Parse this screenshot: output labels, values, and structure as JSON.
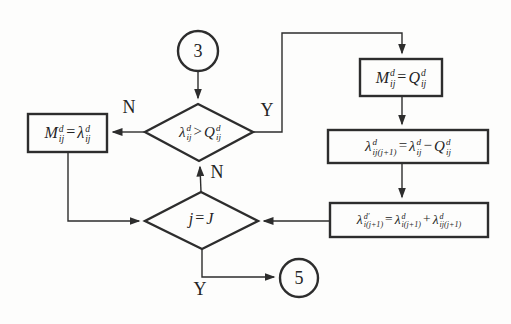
{
  "diagram": {
    "kind": "flowchart",
    "background_color": "#fdfdfc",
    "stroke_color": "#2d2d2d",
    "nodes": {
      "connector_3": {
        "shape": "circle",
        "label": "3"
      },
      "connector_5": {
        "shape": "circle",
        "label": "5"
      },
      "decision_lambda_vs_q": {
        "shape": "diamond",
        "formula": [
          {
            "b": "λ",
            "sup": "d",
            "sub": "ij"
          },
          {
            "b": ">"
          },
          {
            "b": "Q",
            "sup": "d",
            "sub": "ij"
          }
        ]
      },
      "process_m_eq_lambda": {
        "shape": "rect",
        "formula": [
          {
            "b": "M",
            "sup": "d",
            "sub": "ij"
          },
          {
            "b": "="
          },
          {
            "b": "λ",
            "sup": "d",
            "sub": "ij"
          }
        ]
      },
      "process_m_eq_q": {
        "shape": "rect",
        "formula": [
          {
            "b": "M",
            "sup": "d",
            "sub": "ij"
          },
          {
            "b": "="
          },
          {
            "b": "Q",
            "sup": "d",
            "sub": "ij"
          }
        ]
      },
      "process_lambda_carryover": {
        "shape": "rect",
        "formula": [
          {
            "b": "λ",
            "sup": "d",
            "sub": "ij(j+1)"
          },
          {
            "b": "="
          },
          {
            "b": "λ",
            "sup": "d",
            "sub": "ij"
          },
          {
            "b": "−"
          },
          {
            "b": "Q",
            "sup": "d",
            "sub": "ij"
          }
        ]
      },
      "process_lambda_sum": {
        "shape": "rect",
        "formula": [
          {
            "b": "λ",
            "sup": "d′",
            "sub": "i(j+1)"
          },
          {
            "b": "="
          },
          {
            "b": "λ",
            "sup": "d",
            "sub": "i(j+1)"
          },
          {
            "b": "+"
          },
          {
            "b": "λ",
            "sup": "d",
            "sub": "ij(j+1)"
          }
        ]
      },
      "decision_j_eq_J": {
        "shape": "diamond",
        "formula": [
          {
            "b": "j"
          },
          {
            "b": "="
          },
          {
            "b": "J"
          }
        ]
      }
    },
    "branch_labels": {
      "no_to_left": "N",
      "yes_to_right": "Y",
      "no_loop_up": "N",
      "yes_to_exit": "Y"
    }
  }
}
